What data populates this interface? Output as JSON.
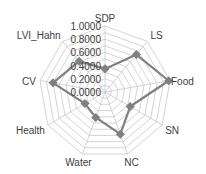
{
  "chart_data": {
    "type": "radar",
    "title": "",
    "categories": [
      "SDP",
      "LS",
      "Food",
      "SN",
      "NC",
      "Water",
      "Health",
      "CV",
      "LVI_Hahn"
    ],
    "series": [
      {
        "name": "Series 1",
        "values": [
          0.35,
          0.74,
          0.98,
          0.44,
          0.68,
          0.41,
          0.35,
          0.8,
          0.61
        ],
        "color": "#808080"
      }
    ],
    "rlim": [
      0.0,
      1.0
    ],
    "tick_values": [
      0.0,
      0.2,
      0.4,
      0.6,
      0.8,
      1.0
    ],
    "tick_labels": [
      "0.0000",
      "0.2000",
      "0.4000",
      "0.6000",
      "0.8000",
      "1.0000"
    ],
    "grid_step": 0.1,
    "grid": true,
    "legend": "none"
  },
  "style": {
    "grid_color": "#c9c9c9",
    "text_color": "#404040",
    "line_color": "#808080"
  }
}
